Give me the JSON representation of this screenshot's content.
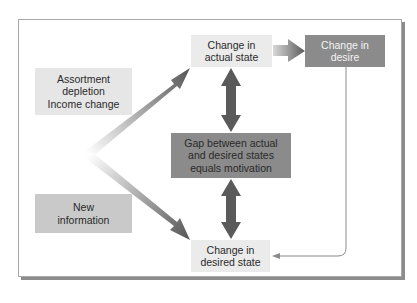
{
  "diagram": {
    "nodes": {
      "actual_state": {
        "label": "Change in\nactual state"
      },
      "desire": {
        "label": "Change in\ndesire"
      },
      "assortment": {
        "label": "Assortment\ndepletion\nIncome change"
      },
      "gap": {
        "label": "Gap between actual\nand desired states\nequals motivation"
      },
      "new_info": {
        "label": "New\ninformation"
      },
      "desired_state": {
        "label": "Change in\ndesired state"
      }
    },
    "edges": [
      {
        "from": "origin",
        "to": "actual_state",
        "style": "gradient-arrow"
      },
      {
        "from": "origin",
        "to": "desired_state",
        "style": "gradient-arrow"
      },
      {
        "from": "actual_state",
        "to": "desire",
        "style": "gradient-arrow"
      },
      {
        "from": "actual_state",
        "to": "gap",
        "style": "double-arrow"
      },
      {
        "from": "gap",
        "to": "desired_state",
        "style": "double-arrow"
      },
      {
        "from": "desire",
        "to": "desired_state",
        "style": "thin-line-arrow"
      }
    ],
    "colors": {
      "light_box": "#ebebeb",
      "medium_box": "#c9c9c9",
      "dark_box": "#8b8b8b",
      "arrow_dark": "#5a5a5a",
      "frame_border": "#a8a8a8"
    }
  }
}
